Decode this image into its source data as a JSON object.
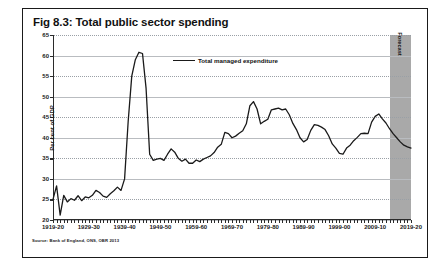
{
  "figure": {
    "title": "Fig 8.3: Total public sector spending",
    "source": "Source: Bank of England, ONS, OBR 2013"
  },
  "legend": {
    "label": "Total managed expenditure"
  },
  "forecast": {
    "label": "Forecast",
    "start_year": 2013,
    "end_year": 2019,
    "color": "#a9a9a9"
  },
  "chart_data": {
    "type": "line",
    "title": "Fig 8.3: Total public sector spending",
    "xlabel": "",
    "ylabel": "Per cent of GDP",
    "ylim": [
      20,
      65
    ],
    "xlim": [
      1919,
      2019
    ],
    "yticks": [
      20,
      25,
      30,
      35,
      40,
      45,
      50,
      55,
      60,
      65
    ],
    "xticks": [
      1919,
      1929,
      1939,
      1949,
      1959,
      1969,
      1979,
      1989,
      1999,
      2009,
      2019
    ],
    "xticklabels": [
      "1919-20",
      "1929-30",
      "1939-40",
      "1949-50",
      "1959-60",
      "1969-70",
      "1979-80",
      "1989-90",
      "1999-00",
      "2009-10",
      "2019-20"
    ],
    "grid": true,
    "legend_position": "upper-center",
    "line_color": "#1a1a1a",
    "series": [
      {
        "name": "Total managed expenditure",
        "x": [
          1919,
          1920,
          1921,
          1922,
          1923,
          1924,
          1925,
          1926,
          1927,
          1928,
          1929,
          1930,
          1931,
          1932,
          1933,
          1934,
          1935,
          1936,
          1937,
          1938,
          1939,
          1940,
          1941,
          1942,
          1943,
          1944,
          1945,
          1946,
          1947,
          1948,
          1949,
          1950,
          1951,
          1952,
          1953,
          1954,
          1955,
          1956,
          1957,
          1958,
          1959,
          1960,
          1961,
          1962,
          1963,
          1964,
          1965,
          1966,
          1967,
          1968,
          1969,
          1970,
          1971,
          1972,
          1973,
          1974,
          1975,
          1976,
          1977,
          1978,
          1979,
          1980,
          1981,
          1982,
          1983,
          1984,
          1985,
          1986,
          1987,
          1988,
          1989,
          1990,
          1991,
          1992,
          1993,
          1994,
          1995,
          1996,
          1997,
          1998,
          1999,
          2000,
          2001,
          2002,
          2003,
          2004,
          2005,
          2006,
          2007,
          2008,
          2009,
          2010,
          2011,
          2012,
          2013,
          2014,
          2015,
          2016,
          2017,
          2018,
          2019
        ],
        "values": [
          25.0,
          28.3,
          21.2,
          26.0,
          24.4,
          25.2,
          24.8,
          25.9,
          24.7,
          25.6,
          25.4,
          26.0,
          27.2,
          26.7,
          25.8,
          25.5,
          26.4,
          27.1,
          28.0,
          27.2,
          30.0,
          44.0,
          55.0,
          59.0,
          60.8,
          60.5,
          52.0,
          36.0,
          34.5,
          34.8,
          35.0,
          34.5,
          36.0,
          37.3,
          36.5,
          35.0,
          34.3,
          34.8,
          33.8,
          33.8,
          34.6,
          34.2,
          34.8,
          35.2,
          35.6,
          36.4,
          37.7,
          38.4,
          41.3,
          41.0,
          40.0,
          40.4,
          41.1,
          41.7,
          43.4,
          47.8,
          48.8,
          47.0,
          43.4,
          44.0,
          44.5,
          46.8,
          47.0,
          47.2,
          46.8,
          47.0,
          45.6,
          43.5,
          42.0,
          40.0,
          39.0,
          39.6,
          41.8,
          43.2,
          43.0,
          42.6,
          42.0,
          40.5,
          38.5,
          37.5,
          36.2,
          36.0,
          37.5,
          38.2,
          39.3,
          40.1,
          41.0,
          41.1,
          41.0,
          43.8,
          45.2,
          45.8,
          44.6,
          43.6,
          42.2,
          41.0,
          40.0,
          39.0,
          38.2,
          37.8,
          37.5
        ]
      }
    ]
  }
}
